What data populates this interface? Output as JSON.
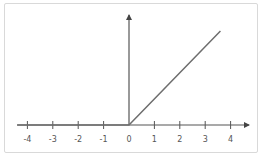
{
  "chart_data": {
    "type": "line",
    "title": "",
    "xlabel": "",
    "ylabel": "",
    "function": "ReLU: y = max(0, x)",
    "series": [
      {
        "name": "relu",
        "x": [
          -4.4,
          0,
          3.6
        ],
        "y": [
          0,
          0,
          3.7
        ],
        "color": "#6e6e6e"
      }
    ],
    "xticks": [
      -4,
      -3,
      -2,
      -1,
      0,
      1,
      2,
      3,
      4
    ],
    "xtick_labels": [
      "-4",
      "-3",
      "-2",
      "-1",
      "0",
      "1",
      "2",
      "3",
      "4"
    ],
    "xlim": [
      -4.4,
      4.6
    ],
    "ylim": [
      0,
      4.4
    ],
    "grid": false,
    "legend": null
  },
  "colors": {
    "axis": "#555555",
    "line": "#6e6e6e",
    "frame_border": "#d9d9d9"
  }
}
